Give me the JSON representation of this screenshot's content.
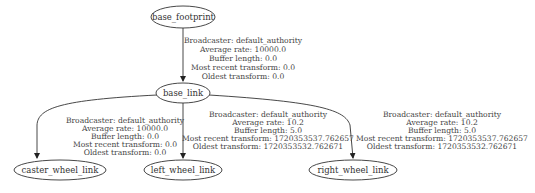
{
  "graph": {
    "type": "tf-tree",
    "nodes": [
      {
        "id": "base_footprint",
        "label": "base_footprint"
      },
      {
        "id": "base_link",
        "label": "base_link"
      },
      {
        "id": "caster_wheel_link",
        "label": "caster_wheel_link"
      },
      {
        "id": "left_wheel_link",
        "label": "left_wheel_link"
      },
      {
        "id": "right_wheel_link",
        "label": "right_wheel_link"
      }
    ],
    "edges": [
      {
        "from": "base_footprint",
        "to": "base_link",
        "lines": [
          "Broadcaster: default_authority",
          "Average rate: 10000.0",
          "Buffer length: 0.0",
          "Most recent transform: 0.0",
          "Oldest transform: 0.0"
        ]
      },
      {
        "from": "base_link",
        "to": "caster_wheel_link",
        "lines": [
          "Broadcaster: default_authority",
          "Average rate: 10000.0",
          "Buffer length: 0.0",
          "Most recent transform: 0.0",
          "Oldest transform: 0.0"
        ]
      },
      {
        "from": "base_link",
        "to": "left_wheel_link",
        "lines": [
          "Broadcaster: default_authority",
          "Average rate: 10.2",
          "Buffer length: 5.0",
          "Most recent transform: 1720353537.762657",
          "Oldest transform: 1720353532.762671"
        ]
      },
      {
        "from": "base_link",
        "to": "right_wheel_link",
        "lines": [
          "Broadcaster: default_authority",
          "Average rate: 10.2",
          "Buffer length: 5.0",
          "Most recent transform: 1720353537.762657",
          "Oldest transform: 1720353532.762671"
        ]
      }
    ]
  },
  "colors": {
    "background": "#ffffff",
    "stroke": "#333333",
    "text": "#333333"
  }
}
